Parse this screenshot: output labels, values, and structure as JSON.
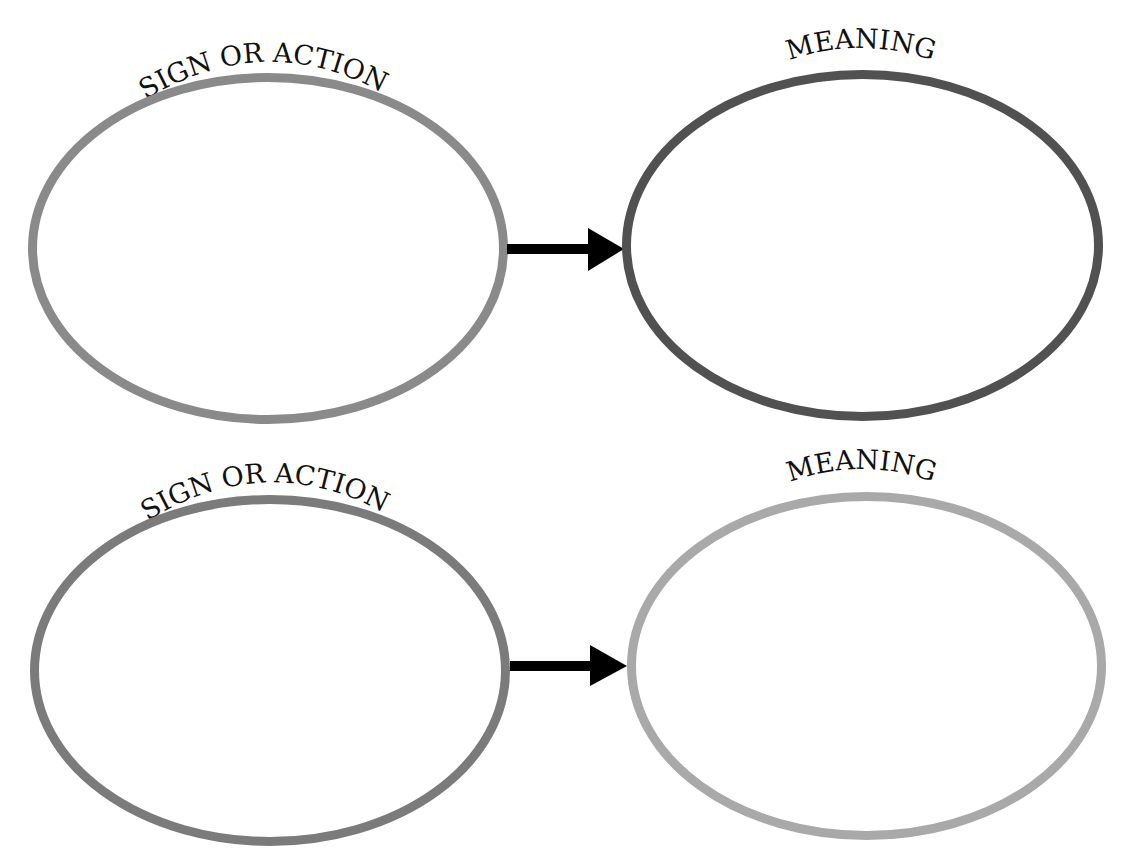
{
  "diagram": {
    "rows": [
      {
        "sign": {
          "label": "SIGN OR ACTION",
          "stroke": "#8a8a8a",
          "content": ""
        },
        "meaning": {
          "label": "MEANING",
          "stroke": "#515151",
          "content": ""
        },
        "arrow": {
          "color": "#000000"
        }
      },
      {
        "sign": {
          "label": "SIGN OR ACTION",
          "stroke": "#7b7b7b",
          "content": ""
        },
        "meaning": {
          "label": "MEANING",
          "stroke": "#a9a9a9",
          "content": ""
        },
        "arrow": {
          "color": "#000000"
        }
      }
    ]
  }
}
